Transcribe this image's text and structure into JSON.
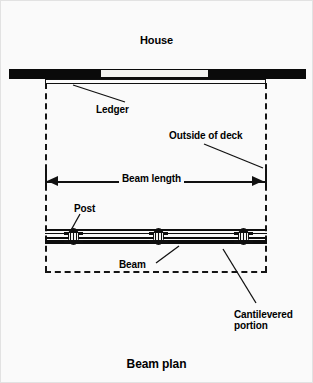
{
  "figure": {
    "title": "House",
    "caption": "Beam plan"
  },
  "labels": {
    "ledger": "Ledger",
    "outside_of_deck": "Outside of deck",
    "beam_length": "Beam length",
    "post": "Post",
    "beam": "Beam",
    "cantilevered_line1": "Cantilevered",
    "cantilevered_line2": "portion"
  },
  "colors": {
    "background": "#fafafa",
    "ink": "#0d0d0d",
    "wall_opening": "#f2f2f0"
  },
  "diagram": {
    "type": "technical-plan-drawing",
    "elements": [
      "house wall band with opening",
      "ledger board attached to house",
      "dashed deck outline",
      "beam length dimension with arrows",
      "beam assembly",
      "three posts",
      "cantilevered beam ends"
    ],
    "post_count": 3
  }
}
